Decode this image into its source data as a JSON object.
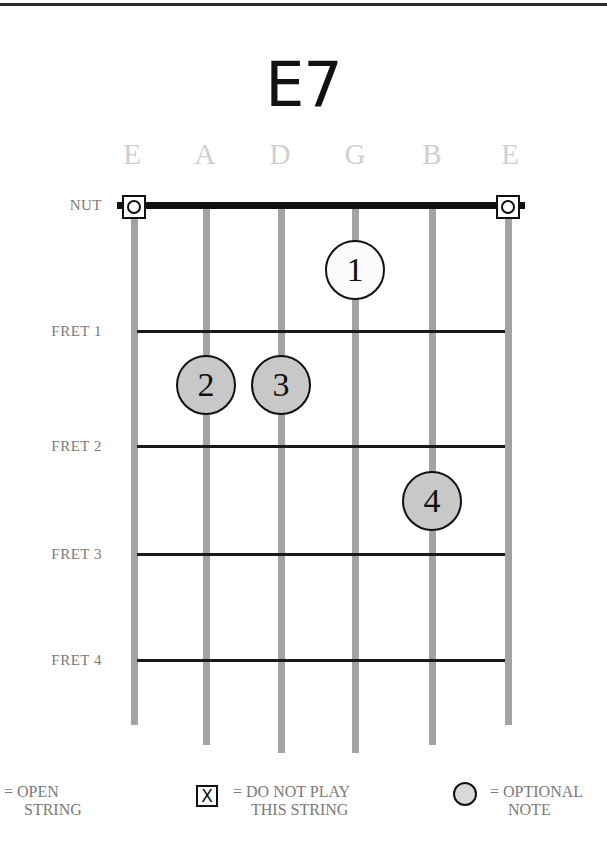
{
  "chord": {
    "name": "E7"
  },
  "strings": [
    {
      "label": "E",
      "x": 134,
      "bottom": 725,
      "open": true
    },
    {
      "label": "A",
      "x": 206,
      "bottom": 745,
      "open": false
    },
    {
      "label": "D",
      "x": 281,
      "bottom": 753,
      "open": false
    },
    {
      "label": "G",
      "x": 355,
      "bottom": 753,
      "open": false
    },
    {
      "label": "B",
      "x": 432,
      "bottom": 745,
      "open": false
    },
    {
      "label": "E",
      "x": 508,
      "bottom": 725,
      "open": true
    }
  ],
  "rows": {
    "nut": {
      "label": "NUT",
      "y": 206
    },
    "frets": [
      {
        "label": "FRET 1",
        "y": 331
      },
      {
        "label": "FRET 2",
        "y": 446
      },
      {
        "label": "FRET 3",
        "y": 554
      },
      {
        "label": "FRET 4",
        "y": 660
      }
    ]
  },
  "fingers": [
    {
      "number": "1",
      "string": "G",
      "fret_position": "between nut and fret 1",
      "x": 355,
      "y": 270,
      "fill": "#fbfbfb"
    },
    {
      "number": "2",
      "string": "A",
      "fret_position": "between fret 1 and fret 2",
      "x": 206,
      "y": 385,
      "fill": "#c8c8c8"
    },
    {
      "number": "3",
      "string": "D",
      "fret_position": "between fret 1 and fret 2",
      "x": 281,
      "y": 385,
      "fill": "#c8c8c8"
    },
    {
      "number": "4",
      "string": "B",
      "fret_position": "between fret 2 and fret 3",
      "x": 432,
      "y": 501,
      "fill": "#c8c8c8"
    }
  ],
  "legend": {
    "open": {
      "line1": "= OPEN",
      "line2": "STRING"
    },
    "do_not_play": {
      "symbol": "X",
      "line1": "= DO NOT PLAY",
      "line2": "THIS STRING"
    },
    "optional": {
      "line1": "= OPTIONAL",
      "line2": "NOTE"
    }
  },
  "colors": {
    "string": "#a3a3a3",
    "fret": "#1a1a1a",
    "label_gray": "#7a7a7a",
    "string_label_gray": "#cfcfcf",
    "finger_gray": "#c8c8c8"
  }
}
